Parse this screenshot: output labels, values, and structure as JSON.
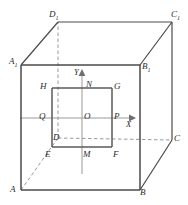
{
  "figure": {
    "kind": "geometry-diagram",
    "width": 188,
    "height": 205,
    "colors": {
      "background": "#ffffff",
      "solid_edge": "#4a4a4a",
      "hidden_edge": "#8c8c8c",
      "inner_square": "#5a5a5a",
      "axis": "#9a9a9a",
      "label_text": "#2b2b2b"
    },
    "cube": {
      "front_face": {
        "name": "ABB1A1",
        "vertices": [
          {
            "id": "A",
            "label": "A",
            "sub": "",
            "x": 21,
            "y": 190
          },
          {
            "id": "B",
            "label": "B",
            "sub": "",
            "x": 140,
            "y": 190
          },
          {
            "id": "B1",
            "label": "B",
            "sub": "1",
            "x": 140,
            "y": 65
          },
          {
            "id": "A1",
            "label": "A",
            "sub": "1",
            "x": 21,
            "y": 65
          }
        ]
      },
      "back_face": {
        "name": "DCC1D1",
        "vertices": [
          {
            "id": "D",
            "label": "D",
            "sub": "",
            "x": 58,
            "y": 138,
            "hidden": true
          },
          {
            "id": "C",
            "label": "C",
            "sub": "",
            "x": 172,
            "y": 140,
            "hidden": false
          },
          {
            "id": "C1",
            "label": "C",
            "sub": "1",
            "x": 172,
            "y": 22,
            "hidden": false
          },
          {
            "id": "D1",
            "label": "D",
            "sub": "1",
            "x": 58,
            "y": 22,
            "hidden": false
          }
        ]
      },
      "connectors": [
        {
          "from": "A",
          "to": "D",
          "hidden": true
        },
        {
          "from": "B",
          "to": "C",
          "hidden": false
        },
        {
          "from": "B1",
          "to": "C1",
          "hidden": false
        },
        {
          "from": "A1",
          "to": "D1",
          "hidden": false
        }
      ]
    },
    "inner_square": {
      "name": "EFGH",
      "vertices": [
        {
          "id": "H",
          "label": "H",
          "x": 52,
          "y": 88
        },
        {
          "id": "G",
          "label": "G",
          "x": 112,
          "y": 88
        },
        {
          "id": "F",
          "label": "F",
          "x": 112,
          "y": 147
        },
        {
          "id": "E",
          "label": "E",
          "x": 52,
          "y": 147
        }
      ]
    },
    "axes": {
      "origin": {
        "id": "O",
        "label": "O",
        "x": 82,
        "y": 118
      },
      "x_axis": {
        "label": "X",
        "from": {
          "x": 20,
          "y": 118
        },
        "to": {
          "x": 133,
          "y": 118
        },
        "arrow": true,
        "label_pos": {
          "x": 126,
          "y": 120
        }
      },
      "y_axis": {
        "label": "Y",
        "from": {
          "x": 82,
          "y": 172
        },
        "to": {
          "x": 82,
          "y": 71
        },
        "arrow": true,
        "label_pos": {
          "x": 75,
          "y": 71
        }
      }
    },
    "midpoints": [
      {
        "id": "N",
        "label": "N",
        "x": 82,
        "y": 88,
        "on": "HG"
      },
      {
        "id": "M",
        "label": "M",
        "x": 82,
        "y": 147,
        "on": "EF"
      },
      {
        "id": "Q",
        "label": "Q",
        "x": 52,
        "y": 118,
        "on": "HE"
      },
      {
        "id": "P",
        "label": "P",
        "x": 112,
        "y": 118,
        "on": "GF"
      }
    ],
    "point_labels": [
      {
        "id": "D1",
        "text": "D",
        "sub": "1",
        "x": 49,
        "y": 10
      },
      {
        "id": "C1",
        "text": "C",
        "sub": "1",
        "x": 171,
        "y": 10
      },
      {
        "id": "A1",
        "text": "A",
        "sub": "1",
        "x": 9,
        "y": 57
      },
      {
        "id": "B1",
        "text": "B",
        "sub": "1",
        "x": 142,
        "y": 62
      },
      {
        "id": "H",
        "text": "H",
        "sub": "",
        "x": 40,
        "y": 82
      },
      {
        "id": "N",
        "text": "N",
        "sub": "",
        "x": 86,
        "y": 80
      },
      {
        "id": "G",
        "text": "G",
        "sub": "",
        "x": 114,
        "y": 82
      },
      {
        "id": "Q",
        "text": "Q",
        "sub": "",
        "x": 39,
        "y": 112
      },
      {
        "id": "O",
        "text": "O",
        "sub": "",
        "x": 84,
        "y": 112
      },
      {
        "id": "P",
        "text": "P",
        "sub": "",
        "x": 114,
        "y": 112
      },
      {
        "id": "X",
        "text": "X",
        "sub": "",
        "x": 126,
        "y": 120
      },
      {
        "id": "Y",
        "text": "Y",
        "sub": "",
        "x": 74,
        "y": 68
      },
      {
        "id": "D",
        "text": "D",
        "sub": "",
        "x": 53,
        "y": 133
      },
      {
        "id": "C",
        "text": "C",
        "sub": "",
        "x": 174,
        "y": 134
      },
      {
        "id": "E",
        "text": "E",
        "sub": "",
        "x": 45,
        "y": 150
      },
      {
        "id": "M",
        "text": "M",
        "sub": "",
        "x": 83,
        "y": 150
      },
      {
        "id": "F",
        "text": "F",
        "sub": "",
        "x": 113,
        "y": 150
      },
      {
        "id": "A",
        "text": "A",
        "sub": "",
        "x": 10,
        "y": 185
      },
      {
        "id": "B",
        "text": "B",
        "sub": "",
        "x": 140,
        "y": 188
      }
    ]
  }
}
